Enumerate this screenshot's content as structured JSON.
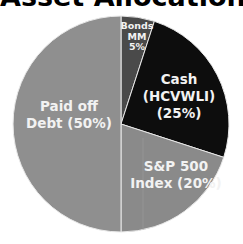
{
  "chart_data": {
    "type": "pie",
    "title": "Asset Allocation",
    "start_angle_deg": 0,
    "direction": "clockwise",
    "slices": [
      {
        "name": "Bonds MM",
        "value": 5,
        "label_lines": [
          "Bonds",
          "MM",
          "5%"
        ],
        "color": "#4a4a4a"
      },
      {
        "name": "Cash (HCVWLI)",
        "value": 25,
        "label_lines": [
          "Cash",
          "(HCVWLI)",
          "(25%)"
        ],
        "color": "#0d0d0d"
      },
      {
        "name": "S&P 500 Index",
        "value": 20,
        "label_lines": [
          "S&P 500",
          "Index (20%)"
        ],
        "color": "#8a8a8a"
      },
      {
        "name": "Paid off Debt",
        "value": 50,
        "label_lines": [
          "Paid off",
          "Debt (50%)"
        ],
        "color": "#8f8f8f"
      }
    ],
    "slice_border_color": "#e8e8e8",
    "legend": "none"
  }
}
